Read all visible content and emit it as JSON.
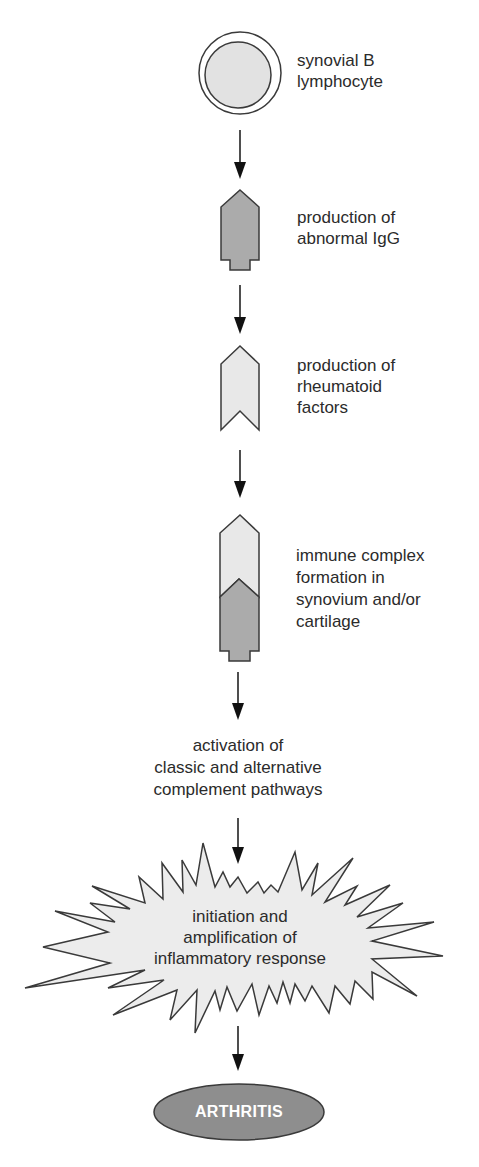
{
  "diagram": {
    "title": "",
    "steps": [
      {
        "id": "b-lymphocyte",
        "shape": "double-circle",
        "lines": [
          "synovial B",
          "lymphocyte"
        ]
      },
      {
        "id": "abnormal-igg",
        "shape": "igg-pentagon-dark",
        "lines": [
          "production of",
          "abnormal IgG"
        ]
      },
      {
        "id": "rheumatoid-factors",
        "shape": "chevron-light",
        "lines": [
          "production of",
          "rheumatoid",
          "factors"
        ]
      },
      {
        "id": "immune-complex",
        "shape": "stacked-chevron-igg",
        "lines": [
          "immune complex",
          "formation in",
          "synovium and/or",
          "cartilage"
        ]
      },
      {
        "id": "complement-activation",
        "shape": "text-only",
        "lines": [
          "activation of",
          "classic and alternative",
          "complement pathways"
        ]
      },
      {
        "id": "inflammatory-response",
        "shape": "starburst",
        "lines": [
          "initiation and",
          "amplification of",
          "inflammatory response"
        ]
      },
      {
        "id": "arthritis",
        "shape": "ellipse-dark",
        "lines": [
          "ARTHRITIS"
        ]
      }
    ],
    "edges": [
      {
        "from": "b-lymphocyte",
        "to": "abnormal-igg"
      },
      {
        "from": "abnormal-igg",
        "to": "rheumatoid-factors"
      },
      {
        "from": "rheumatoid-factors",
        "to": "immune-complex"
      },
      {
        "from": "immune-complex",
        "to": "complement-activation"
      },
      {
        "from": "complement-activation",
        "to": "inflammatory-response"
      },
      {
        "from": "inflammatory-response",
        "to": "arthritis"
      }
    ],
    "colors": {
      "stroke": "#3a3a3a",
      "light_fill": "#e6e6e6",
      "dark_fill": "#a9a9a9",
      "outcome_fill": "#8c8c8c",
      "outcome_text": "#ffffff"
    }
  }
}
